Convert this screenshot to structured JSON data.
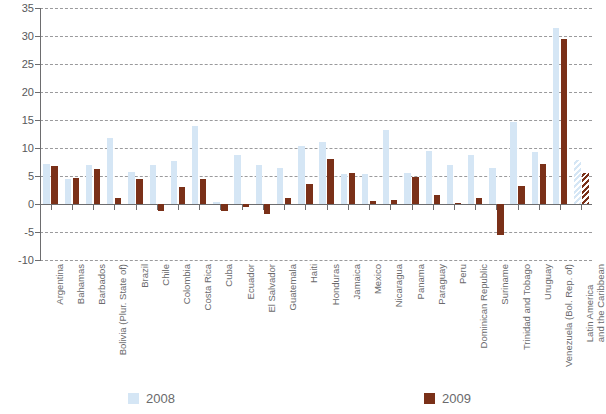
{
  "figure": {
    "title_partial": "",
    "background": "#ffffff"
  },
  "legend": {
    "position": "bottom",
    "items": [
      {
        "label": "2008",
        "color": "#d5e6f5",
        "icon": "square-swatch"
      },
      {
        "label": "2009",
        "color": "#7a3018",
        "icon": "square-swatch"
      }
    ]
  },
  "chart_data": {
    "type": "bar",
    "title": "",
    "subtitle": "",
    "xlabel": "",
    "ylabel": "",
    "ylim": [
      -10,
      35
    ],
    "ytick_step": 5,
    "yticks": [
      "35",
      "30",
      "25",
      "20",
      "15",
      "10",
      "5",
      "0",
      "-5",
      "-10"
    ],
    "grid": true,
    "grid_style": "dashed horizontal",
    "orientation": "vertical grouped",
    "categories": [
      "Argentina",
      "Bahamas",
      "Barbados",
      "Bolivia (Plur. State of)",
      "Brazil",
      "Chile",
      "Colombia",
      "Costa Rica",
      "Cuba",
      "Ecuador",
      "El Salvador",
      "Guatemala",
      "Haiti",
      "Honduras",
      "Jamaica",
      "Mexico",
      "Nicaragua",
      "Panama",
      "Paraguay",
      "Peru",
      "Dominican Republic",
      "Suriname",
      "Trinidad and Tobago",
      "Uruguay",
      "Venezuela (Bol. Rep. of)",
      "Latin America and the Caribbean"
    ],
    "series": [
      {
        "name": "2008",
        "color": "#d5e6f5",
        "values": [
          7.2,
          4.5,
          7.0,
          11.8,
          5.7,
          7.0,
          7.7,
          13.9,
          0.3,
          8.8,
          7.0,
          6.4,
          10.3,
          11.0,
          5.3,
          5.3,
          13.2,
          5.6,
          9.5,
          7.0,
          8.8,
          6.5,
          14.6,
          9.3,
          31.5,
          7.9
        ],
        "hatched_last": true
      },
      {
        "name": "2009",
        "color": "#7a3018",
        "values": [
          6.7,
          4.7,
          6.3,
          1.0,
          4.4,
          -1.2,
          3.1,
          4.5,
          -1.2,
          -0.6,
          -1.8,
          1.0,
          3.6,
          8.1,
          5.6,
          0.5,
          0.8,
          4.9,
          1.6,
          0.2,
          1.1,
          -5.5,
          3.3,
          7.1,
          29.5,
          5.5
        ],
        "hatched_last": true
      }
    ]
  }
}
